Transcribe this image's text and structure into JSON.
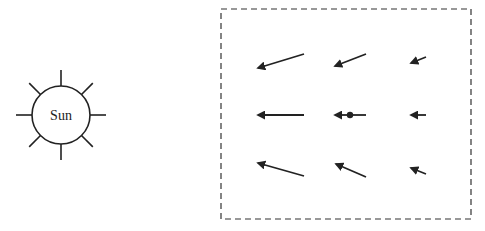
{
  "diagram": {
    "sun": {
      "label": "Sun",
      "center": [
        61,
        115
      ],
      "radius": 29,
      "ray_count": 8
    },
    "field_box": {
      "x": 221,
      "y": 9,
      "width": 250,
      "height": 210,
      "style": "dashed"
    },
    "arrows": [
      {
        "row": 0,
        "col": 0,
        "from": [
          304,
          54
        ],
        "to": [
          258,
          68
        ]
      },
      {
        "row": 0,
        "col": 1,
        "from": [
          366,
          54
        ],
        "to": [
          335,
          66
        ]
      },
      {
        "row": 0,
        "col": 2,
        "from": [
          426,
          57
        ],
        "to": [
          411,
          63
        ]
      },
      {
        "row": 1,
        "col": 0,
        "from": [
          304,
          115
        ],
        "to": [
          258,
          115
        ]
      },
      {
        "row": 1,
        "col": 1,
        "from": [
          366,
          115
        ],
        "to": [
          335,
          115
        ],
        "dot": [
          350,
          115
        ]
      },
      {
        "row": 1,
        "col": 2,
        "from": [
          426,
          115
        ],
        "to": [
          411,
          115
        ]
      },
      {
        "row": 2,
        "col": 0,
        "from": [
          304,
          176
        ],
        "to": [
          258,
          163
        ]
      },
      {
        "row": 2,
        "col": 1,
        "from": [
          366,
          177
        ],
        "to": [
          336,
          164
        ]
      },
      {
        "row": 2,
        "col": 2,
        "from": [
          426,
          174
        ],
        "to": [
          411,
          168
        ]
      }
    ],
    "colors": {
      "stroke": "#222222",
      "background": "#ffffff"
    }
  }
}
